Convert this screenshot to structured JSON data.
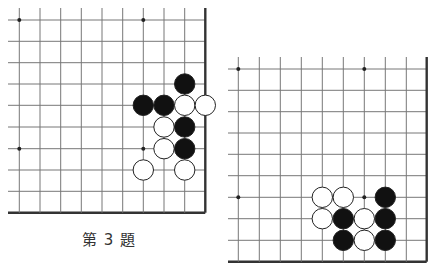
{
  "colors": {
    "line": "#777777",
    "edge": "#333333",
    "black": "#111111",
    "white": "#ffffff",
    "stone_outline": "#222222",
    "star": "#222222"
  },
  "boards": [
    {
      "name": "problem-3-board",
      "xs": [
        19.3,
        40,
        60.7,
        81.3,
        102,
        122.7,
        143.3,
        164,
        184.7,
        205.3
      ],
      "ys": [
        20,
        41.3,
        62.7,
        84,
        105.3,
        127,
        148.7,
        170,
        191.3,
        212.7
      ],
      "line_left": 8,
      "line_top": 8,
      "right_edge": true,
      "bottom_edge": true,
      "stars": [
        [
          0,
          0
        ],
        [
          6,
          0
        ],
        [
          0,
          6
        ],
        [
          6,
          6
        ]
      ],
      "stones": [
        {
          "c": 8,
          "r": 3,
          "color": "black"
        },
        {
          "c": 6,
          "r": 4,
          "color": "black"
        },
        {
          "c": 7,
          "r": 4,
          "color": "black"
        },
        {
          "c": 8,
          "r": 4,
          "color": "white"
        },
        {
          "c": 9,
          "r": 4,
          "color": "white"
        },
        {
          "c": 7,
          "r": 5,
          "color": "white"
        },
        {
          "c": 8,
          "r": 5,
          "color": "black"
        },
        {
          "c": 7,
          "r": 6,
          "color": "white"
        },
        {
          "c": 8,
          "r": 6,
          "color": "black"
        },
        {
          "c": 6,
          "r": 7,
          "color": "white"
        },
        {
          "c": 8,
          "r": 7,
          "color": "white"
        }
      ]
    },
    {
      "name": "second-board",
      "xs": [
        238.3,
        259.3,
        280.3,
        301.3,
        322.3,
        343.3,
        364.3,
        385.3,
        406.3,
        426.7
      ],
      "ys": [
        69,
        90.3,
        111.7,
        133,
        154.3,
        175.7,
        197.3,
        218.7,
        240.3,
        261.7
      ],
      "line_left": 228,
      "line_top": 57,
      "right_edge": true,
      "bottom_edge": true,
      "stars": [
        [
          0,
          0
        ],
        [
          6,
          0
        ],
        [
          0,
          6
        ],
        [
          6,
          6
        ]
      ],
      "stones": [
        {
          "c": 4,
          "r": 6,
          "color": "white"
        },
        {
          "c": 5,
          "r": 6,
          "color": "white"
        },
        {
          "c": 7,
          "r": 6,
          "color": "black"
        },
        {
          "c": 4,
          "r": 7,
          "color": "white"
        },
        {
          "c": 5,
          "r": 7,
          "color": "black"
        },
        {
          "c": 6,
          "r": 7,
          "color": "white"
        },
        {
          "c": 7,
          "r": 7,
          "color": "black"
        },
        {
          "c": 5,
          "r": 8,
          "color": "black"
        },
        {
          "c": 6,
          "r": 8,
          "color": "white"
        },
        {
          "c": 7,
          "r": 8,
          "color": "black"
        }
      ]
    }
  ],
  "stone_radius": 10.2,
  "caption": {
    "text": "第 3 題"
  }
}
